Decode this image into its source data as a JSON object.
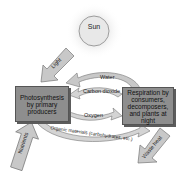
{
  "diagram": {
    "sun": {
      "label": "Sun"
    },
    "producers": {
      "label": "Photosynthesis by primary producers"
    },
    "consumers": {
      "label": "Respiration by consumers, decomposers, and plants at night"
    },
    "flows": {
      "light": "Light",
      "water": "Water",
      "carbon_dioxide": "Carbon dioxide",
      "oxygen": "Oxygen",
      "organic": "Organic materials (carbohydrates, etc.)",
      "nutrients": "Nutrients",
      "waste_heat": "Waste heat"
    },
    "colors": {
      "box": "#8e8e8e",
      "arrow": "#c8c8c8",
      "sun": "#e8e8e8"
    }
  }
}
